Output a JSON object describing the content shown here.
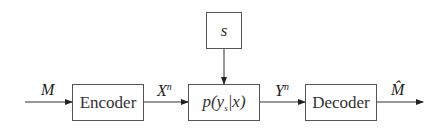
{
  "diagram": {
    "type": "block-diagram",
    "title": "",
    "blocks": {
      "state": {
        "label": "s"
      },
      "encoder": {
        "label": "Encoder"
      },
      "channel": {
        "label_p": "p(",
        "label_y": "y",
        "label_sub": "s",
        "label_rest": "|x)"
      },
      "decoder": {
        "label": "Decoder"
      }
    },
    "signals": {
      "message": {
        "label": "M"
      },
      "x": {
        "base": "X",
        "sup": "n"
      },
      "y": {
        "base": "Y",
        "sup": "n"
      },
      "estimate": {
        "label": "M̂"
      }
    },
    "edges": [
      {
        "from": "input",
        "to": "encoder",
        "label": "M"
      },
      {
        "from": "encoder",
        "to": "channel",
        "label": "X^n"
      },
      {
        "from": "state",
        "to": "channel",
        "label": ""
      },
      {
        "from": "channel",
        "to": "decoder",
        "label": "Y^n"
      },
      {
        "from": "decoder",
        "to": "output",
        "label": "M̂"
      }
    ]
  }
}
